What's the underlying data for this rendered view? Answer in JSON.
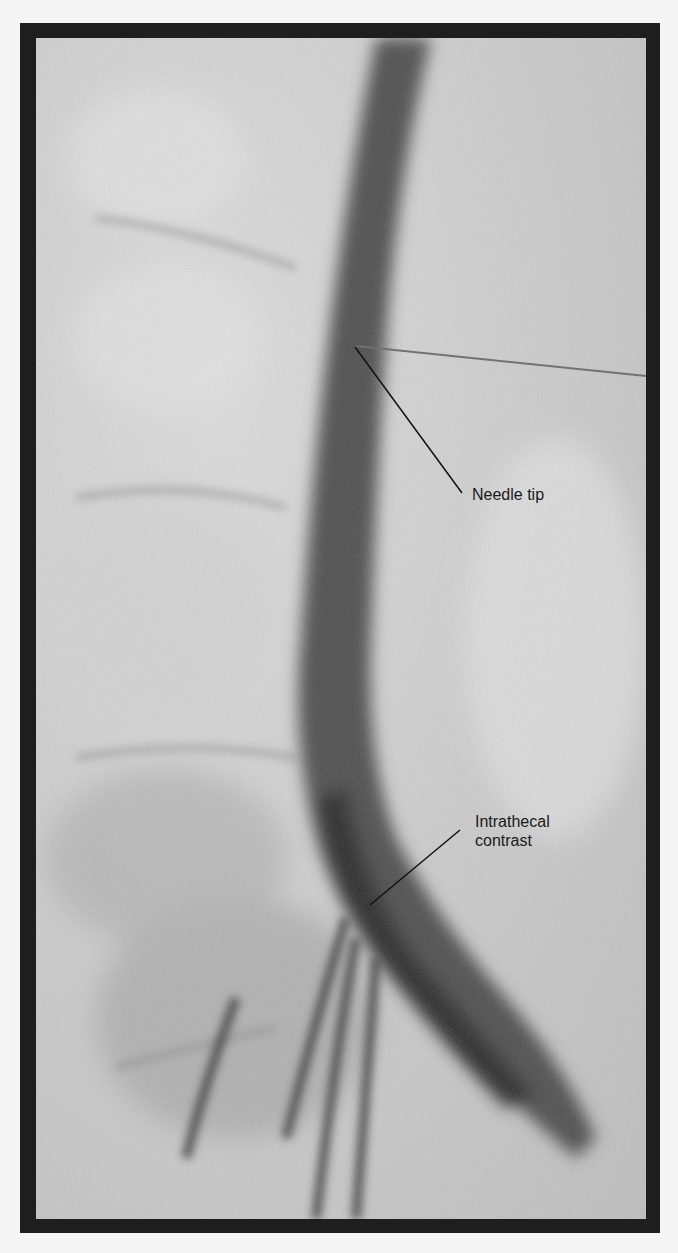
{
  "figure": {
    "annotations": [
      {
        "id": "needle",
        "label": "Needle tip"
      },
      {
        "id": "contrast",
        "label_line1": "Intrathecal",
        "label_line2": "contrast"
      }
    ]
  }
}
